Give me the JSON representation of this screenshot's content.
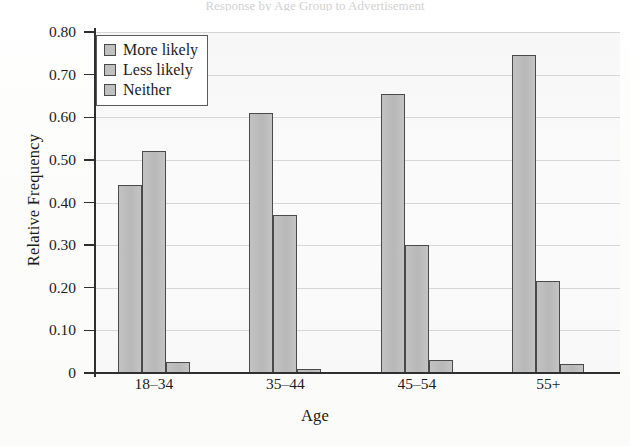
{
  "title_sliver": "Response by Age Group to Advertisement",
  "chart_data": {
    "type": "bar",
    "title": "",
    "xlabel": "Age",
    "ylabel": "Relative Frequency",
    "categories": [
      "18–34",
      "35–44",
      "45–54",
      "55+"
    ],
    "series": [
      {
        "name": "More likely",
        "values": [
          0.44,
          0.61,
          0.655,
          0.745
        ]
      },
      {
        "name": "Less likely",
        "values": [
          0.52,
          0.37,
          0.3,
          0.215
        ]
      },
      {
        "name": "Neither",
        "values": [
          0.027,
          0.01,
          0.03,
          0.02
        ]
      }
    ],
    "ylim": [
      0,
      0.8
    ],
    "yticks": [
      0,
      0.1,
      0.2,
      0.3,
      0.4,
      0.5,
      0.6,
      0.7,
      0.8
    ],
    "ytick_labels": [
      "0",
      "0.10",
      "0.20",
      "0.30",
      "0.40",
      "0.50",
      "0.60",
      "0.70",
      "0.80"
    ],
    "grid": true,
    "legend_position": "top-left",
    "bar_color": "#bdbdbd",
    "bar_edge_color": "#4a4a4a",
    "plot_background": "#fafafa"
  }
}
